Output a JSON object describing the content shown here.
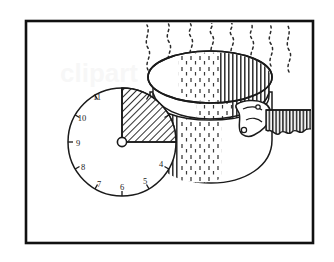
{
  "illustration": {
    "title": "Clock face with shaded quarter overlapping a steaming cooking pot",
    "style": "black-and-white pen line art inside a rectangular border",
    "background_color": "#ffffff",
    "ink_color": "#1a1a1a",
    "hatch_color": "#2b2b2b"
  },
  "frame": {
    "name": "picture-border",
    "x": 26,
    "y": 21,
    "width": 287,
    "height": 222,
    "stroke_width": 2.6,
    "color": "#111111"
  },
  "clock": {
    "name": "clock-face",
    "center_x": 122,
    "center_y": 142,
    "radius": 54,
    "hub_radius": 4.6,
    "stroke_width": 1.4,
    "shaded_sector": {
      "label": "quarter-hour-shaded-sector",
      "start_hour": 12,
      "end_hour": 3,
      "start_angle_deg": -90,
      "end_angle_deg": 0,
      "sweep_deg": 90,
      "fill": "diagonal-hatch"
    },
    "visible_numerals": [
      "11",
      "10",
      "9",
      "8",
      "7",
      "6",
      "5",
      "4"
    ],
    "hidden_numerals": [
      "12",
      "1",
      "2",
      "3"
    ],
    "numeral_positions": [
      {
        "label": "11",
        "hour": 11,
        "x": 97,
        "y": 97
      },
      {
        "label": "10",
        "hour": 10,
        "x": 80,
        "y": 118
      },
      {
        "label": "9",
        "hour": 9,
        "x": 74,
        "y": 143
      },
      {
        "label": "8",
        "hour": 8,
        "x": 80,
        "y": 167
      },
      {
        "label": "7",
        "hour": 7,
        "x": 96,
        "y": 185
      },
      {
        "label": "6",
        "hour": 6,
        "x": 121,
        "y": 193
      },
      {
        "label": "5",
        "hour": 5,
        "x": 145,
        "y": 186
      },
      {
        "label": "4",
        "hour": 4,
        "x": 163,
        "y": 168
      }
    ],
    "tick_count": 12,
    "tick_length": 5
  },
  "pot": {
    "name": "cooking-pot",
    "rim_center_x": 210,
    "rim_center_y": 77,
    "rim_rx": 62,
    "rim_ry": 26,
    "inner_rim_center_y": 92,
    "inner_rim_rx": 57,
    "inner_rim_ry": 22,
    "body_left": 150,
    "body_right": 272,
    "body_bottom_y": 182,
    "shading": "vertical-line-hatch",
    "stroke_width": 1.4
  },
  "handle": {
    "name": "pot-handle",
    "x_start": 268,
    "x_end": 313,
    "y_top": 110,
    "y_bottom": 132,
    "style": "ribbed scalloped cylinder",
    "rib_count": 13,
    "bracket_label": "handle-mounting-bracket"
  },
  "steam": {
    "name": "steam-wisps",
    "count": 8,
    "style": "dotted wavy vertical lines",
    "top_y": 24,
    "bottom_y": 70,
    "x_positions": [
      150,
      170,
      191,
      212,
      232,
      252,
      272,
      290
    ]
  }
}
